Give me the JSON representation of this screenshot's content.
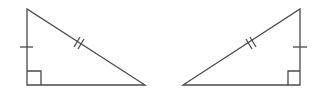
{
  "diagram": {
    "stroke_color": "#4a4a4a",
    "background": "#ffffff",
    "triangles": [
      {
        "name": "left-triangle",
        "vertices": [
          [
            27,
            9
          ],
          [
            27,
            85
          ],
          [
            145,
            85
          ]
        ],
        "right_angle_at": [
          27,
          85
        ],
        "marks": {
          "vertical_leg": "single-tick",
          "hypotenuse": "double-tick"
        }
      },
      {
        "name": "right-triangle",
        "vertices": [
          [
            300,
            9
          ],
          [
            300,
            85
          ],
          [
            183,
            85
          ]
        ],
        "right_angle_at": [
          300,
          85
        ],
        "marks": {
          "vertical_leg": "single-tick",
          "hypotenuse": "double-tick"
        }
      }
    ]
  }
}
